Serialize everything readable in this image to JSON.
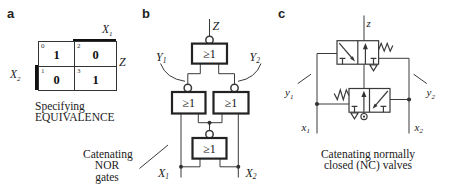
{
  "colors": {
    "ink": "#1a1a1a",
    "line": "#3a3a3a",
    "emphasis_bar": "#111111",
    "background": "#ffffff"
  },
  "panels": {
    "a": {
      "label": "a",
      "kmap": {
        "col_label": {
          "base": "X",
          "sub": "1"
        },
        "row_label": {
          "base": "X",
          "sub": "2"
        },
        "output_label": "Z",
        "cells": [
          {
            "idx": "0",
            "val": "1"
          },
          {
            "idx": "2",
            "val": "0"
          },
          {
            "idx": "1",
            "val": "0"
          },
          {
            "idx": "3",
            "val": "1"
          }
        ]
      },
      "caption_line1": "Specifying",
      "caption_line2": "EQUIVALENCE",
      "callout_line1": "Catenating",
      "callout_line2": "NOR gates"
    },
    "b": {
      "label": "b",
      "gate_symbol": "≥1",
      "output_label": "Z",
      "y1": {
        "base": "Y",
        "sub": "1"
      },
      "y2": {
        "base": "Y",
        "sub": "2"
      },
      "x1": {
        "base": "X",
        "sub": "1"
      },
      "x2": {
        "base": "X",
        "sub": "2"
      }
    },
    "c": {
      "label": "c",
      "output_label": "z",
      "y1": {
        "base": "y",
        "sub": "1"
      },
      "y2": {
        "base": "y",
        "sub": "2"
      },
      "x1": {
        "base": "x",
        "sub": "1"
      },
      "x2": {
        "base": "x",
        "sub": "2"
      },
      "caption_line1": "Catenating normally",
      "caption_line2": "closed (NC) valves"
    }
  }
}
